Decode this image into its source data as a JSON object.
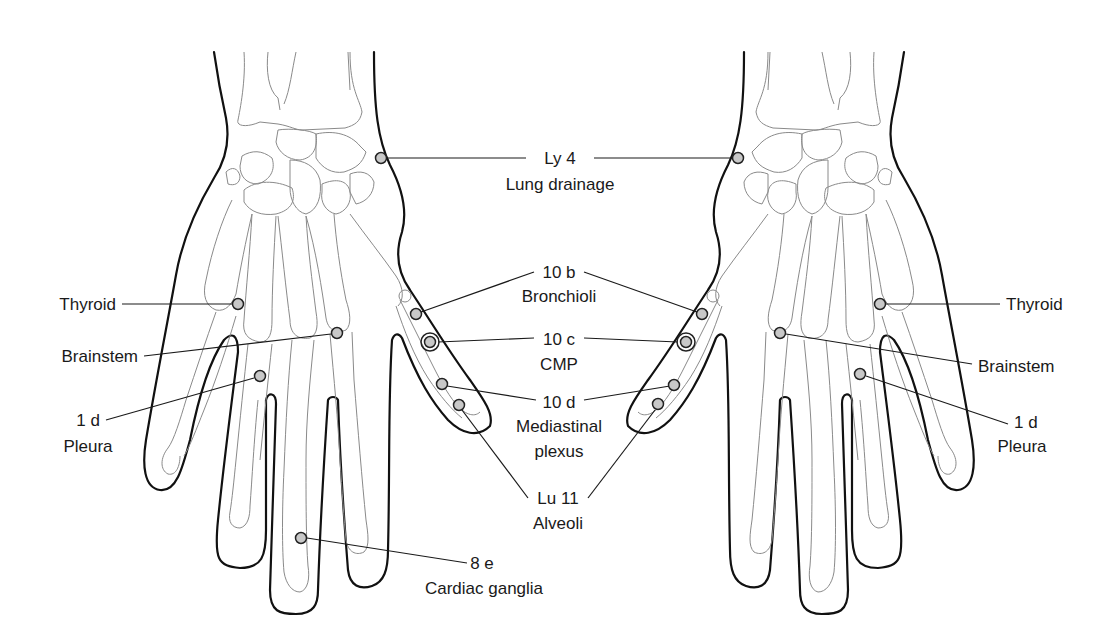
{
  "figure": {
    "point_fill": "#c8c8c8",
    "stroke_color": "#1a1a1a",
    "labels": {
      "ly4_code": "Ly 4",
      "ly4_name": "Lung drainage",
      "b10_code": "10 b",
      "b10_name": "Bronchioli",
      "c10_code": "10 c",
      "c10_name": "CMP",
      "d10_code": "10 d",
      "d10_name_line1": "Mediastinal",
      "d10_name_line2": "plexus",
      "lu11_code": "Lu 11",
      "lu11_name": "Alveoli",
      "e8_code": "8 e",
      "e8_name": "Cardiac ganglia",
      "left_thyroid": "Thyroid",
      "left_brainstem": "Brainstem",
      "left_1d_code": "1 d",
      "left_1d_name": "Pleura",
      "right_thyroid": "Thyroid",
      "right_brainstem": "Brainstem",
      "right_1d_code": "1 d",
      "right_1d_name": "Pleura"
    },
    "points": [
      {
        "id": "ly4",
        "hands": [
          "left",
          "right"
        ],
        "marker": "dot"
      },
      {
        "id": "thyroid",
        "hands": [
          "left",
          "right"
        ],
        "marker": "dot"
      },
      {
        "id": "brainstem",
        "hands": [
          "left",
          "right"
        ],
        "marker": "dot"
      },
      {
        "id": "1d",
        "hands": [
          "left",
          "right"
        ],
        "marker": "dot"
      },
      {
        "id": "10b",
        "hands": [
          "left",
          "right"
        ],
        "marker": "dot"
      },
      {
        "id": "10c",
        "hands": [
          "left",
          "right"
        ],
        "marker": "ringed-dot"
      },
      {
        "id": "10d",
        "hands": [
          "left",
          "right"
        ],
        "marker": "dot"
      },
      {
        "id": "lu11",
        "hands": [
          "left",
          "right"
        ],
        "marker": "dot"
      },
      {
        "id": "8e",
        "hands": [
          "left"
        ],
        "marker": "dot"
      }
    ]
  }
}
